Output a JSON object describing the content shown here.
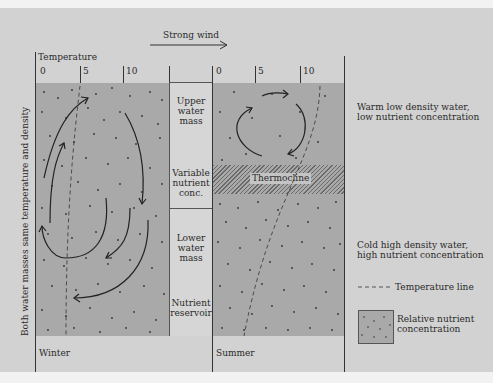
{
  "diagram": {
    "wind_label": "Strong wind",
    "temperature_axis": {
      "label": "Temperature",
      "ticks": [
        "0",
        "5",
        "10"
      ]
    },
    "summer_axis_ticks": [
      "0",
      "5",
      "10"
    ],
    "side_label": "Both water masses same temperature and density",
    "panels": {
      "winter": {
        "label": "Winter"
      },
      "summer": {
        "label": "Summer",
        "thermocline_label": "Thermocline"
      }
    },
    "center_column": [
      {
        "label": "Upper water mass"
      },
      {
        "label": "Variable nutrient conc."
      },
      {
        "label": "Lower water mass"
      },
      {
        "label": "Nutrient reservoir"
      }
    ],
    "annotations": {
      "upper": "Warm low density water, low nutrient concentration",
      "lower": "Cold high density water, high nutrient concentration"
    },
    "legend": {
      "temperature_line": "Temperature line",
      "nutrient": "Relative nutrient concentration"
    },
    "colors": {
      "background": "#d2d2d2",
      "water": "#a9a9a9",
      "ink": "#2a2a2a"
    }
  }
}
